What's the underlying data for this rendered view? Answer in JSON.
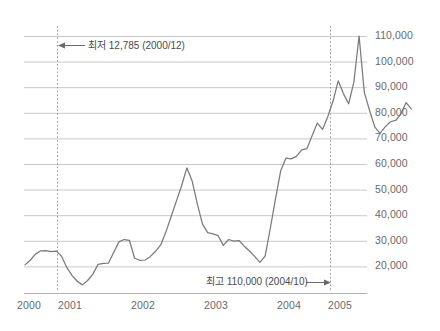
{
  "chart_data": {
    "type": "line",
    "title": "",
    "subtitle": "",
    "xlabel": "",
    "ylabel": "",
    "xlim": [
      "2000-01",
      "2005-06"
    ],
    "ylim": [
      10000,
      110000
    ],
    "ytick_step": 10000,
    "grid": true,
    "legend": "none",
    "line_color": "#7a7a7a",
    "grid_color": "#c9c9c9",
    "axis_color": "#b0b0b0",
    "marker_line_color": "#9a9a9a",
    "categories": [
      "2000/01",
      "2000/02",
      "2000/03",
      "2000/04",
      "2000/05",
      "2000/06",
      "2000/07",
      "2000/08",
      "2000/09",
      "2000/10",
      "2000/11",
      "2000/12",
      "2001/01",
      "2001/02",
      "2001/03",
      "2001/04",
      "2001/05",
      "2001/06",
      "2001/07",
      "2001/08",
      "2001/09",
      "2001/10",
      "2001/11",
      "2001/12",
      "2002/01",
      "2002/02",
      "2002/03",
      "2002/04",
      "2002/05",
      "2002/06",
      "2002/07",
      "2002/08",
      "2002/09",
      "2002/10",
      "2002/11",
      "2002/12",
      "2003/01",
      "2003/02",
      "2003/03",
      "2003/04",
      "2003/05",
      "2003/06",
      "2003/07",
      "2003/08",
      "2003/09",
      "2003/10",
      "2003/11",
      "2003/12",
      "2004/01",
      "2004/02",
      "2004/03",
      "2004/04",
      "2004/05",
      "2004/06",
      "2004/07",
      "2004/08",
      "2004/09",
      "2004/10",
      "2004/11",
      "2004/12",
      "2005/01",
      "2005/02",
      "2005/03",
      "2005/04",
      "2005/05",
      "2005/06"
    ],
    "values": [
      20600,
      22400,
      24800,
      26100,
      26200,
      25800,
      26000,
      24000,
      19600,
      16500,
      14200,
      12785,
      14500,
      17000,
      20800,
      21200,
      21300,
      25500,
      29600,
      30500,
      30200,
      23200,
      22400,
      22500,
      23800,
      25900,
      28400,
      33500,
      39500,
      45500,
      51500,
      58500,
      53500,
      44500,
      36500,
      33200,
      32700,
      32000,
      28200,
      30500,
      29900,
      30100,
      27900,
      26000,
      23900,
      21600,
      24000,
      35000,
      46500,
      57500,
      62300,
      62000,
      63000,
      65500,
      66000,
      71000,
      76000,
      73500,
      78500,
      84500,
      92500,
      87500,
      83500,
      92000,
      110000,
      88000
    ],
    "values_extra": [
      81000,
      74500,
      72000,
      74500,
      76500,
      77000,
      79500,
      84000,
      81500
    ],
    "ytick_labels": [
      "110,000",
      "100,000",
      "90,000",
      "80,000",
      "70,000",
      "60,000",
      "50,000",
      "40,000",
      "30,000",
      "20,000"
    ],
    "ytick_values": [
      110000,
      100000,
      90000,
      80000,
      70000,
      60000,
      50000,
      40000,
      30000,
      20000
    ],
    "xtick_labels": [
      "2000",
      "2001",
      "2002",
      "2003",
      "2004",
      "2005"
    ],
    "xtick_values": [
      "2000",
      "2001",
      "2002",
      "2003",
      "2004",
      "2005"
    ],
    "annotations": [
      {
        "id": "min-annotation",
        "text": "최저 12,785 (2000/12)",
        "value": 12785,
        "date": "2000/12",
        "arrow": "left"
      },
      {
        "id": "max-annotation",
        "text": "최고 110,000 (2004/10)",
        "value": 110000,
        "date": "2004/10",
        "arrow": "right"
      }
    ],
    "marker_lines": [
      {
        "id": "min-marker-line",
        "date": "2000/12",
        "style": "dotted"
      },
      {
        "id": "max-marker-line",
        "date": "2004/10",
        "style": "dotted"
      }
    ]
  }
}
